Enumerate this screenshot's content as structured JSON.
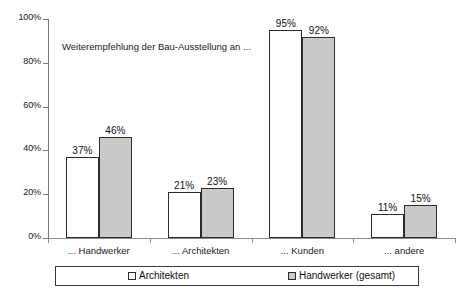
{
  "chart_data": {
    "type": "bar",
    "title": "",
    "annotation": "Weiterempfehlung der Bau-Ausstellung an ...",
    "categories": [
      "... Handwerker",
      "... Architekten",
      "... Kunden",
      "... andere"
    ],
    "series": [
      {
        "name": "Architekten",
        "color": "#ffffff",
        "values": [
          37,
          21,
          95,
          11
        ],
        "labels": [
          "37%",
          "21%",
          "95%",
          "11%"
        ]
      },
      {
        "name": "Handwerker (gesamt)",
        "color": "#c9c9c9",
        "values": [
          46,
          23,
          92,
          15
        ],
        "labels": [
          "46%",
          "23%",
          "92%",
          "15%"
        ]
      }
    ],
    "xlabel": "",
    "ylabel": "",
    "ylim": [
      0,
      100
    ],
    "yticks": [
      0,
      20,
      40,
      60,
      80,
      100
    ],
    "ytick_labels": [
      "0%",
      "20%",
      "40%",
      "60%",
      "80%",
      "100%"
    ],
    "grid": false,
    "legend_position": "bottom"
  },
  "legend": {
    "entries": [
      {
        "label": "Architekten",
        "swatch": "series-a-swatch"
      },
      {
        "label": "Handwerker (gesamt)",
        "swatch": "series-b-swatch"
      }
    ]
  }
}
